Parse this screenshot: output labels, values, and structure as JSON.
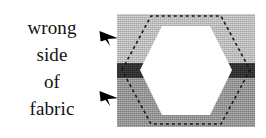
{
  "figure": {
    "width": 266,
    "height": 138,
    "background": "#ffffff",
    "title": "wrong side of fabric"
  },
  "caption": {
    "lines": [
      {
        "text": "wrong"
      },
      {
        "text": "side"
      },
      {
        "text": "of"
      },
      {
        "text": "fabric"
      }
    ],
    "color": "#111111",
    "align": "center"
  },
  "pointers": [
    {
      "name": "upper-arrow",
      "icon": "arrow-right-solid-icon",
      "direction": "right",
      "color": "#000000",
      "target": "band-top"
    },
    {
      "name": "lower-arrow",
      "icon": "arrow-right-solid-icon",
      "direction": "right",
      "color": "#000000",
      "target": "band-bottom"
    }
  ],
  "fabric_panel": {
    "bands": [
      {
        "name": "top-band",
        "label": "wrong side of fabric (light grey)",
        "color": "#c8c8c8"
      },
      {
        "name": "middle-band",
        "label": "dark stripe",
        "color": "#2a2a2a"
      },
      {
        "name": "bottom-band",
        "label": "wrong side of fabric (medium grey)",
        "color": "#969696"
      }
    ],
    "patch": {
      "name": "hexagon-patch",
      "shape": "hexagon",
      "fill": "#ffffff",
      "points": "23,56 45,12 93,12 115,56 93,101 45,101"
    },
    "seam_line": {
      "name": "dashed-seam-allowance-line",
      "style": "dashed",
      "color": "#1a1a1a",
      "dash": "3 3",
      "width": 1.6,
      "points": "5,56 34,2 104,2 133,56 104,110 34,110"
    }
  }
}
